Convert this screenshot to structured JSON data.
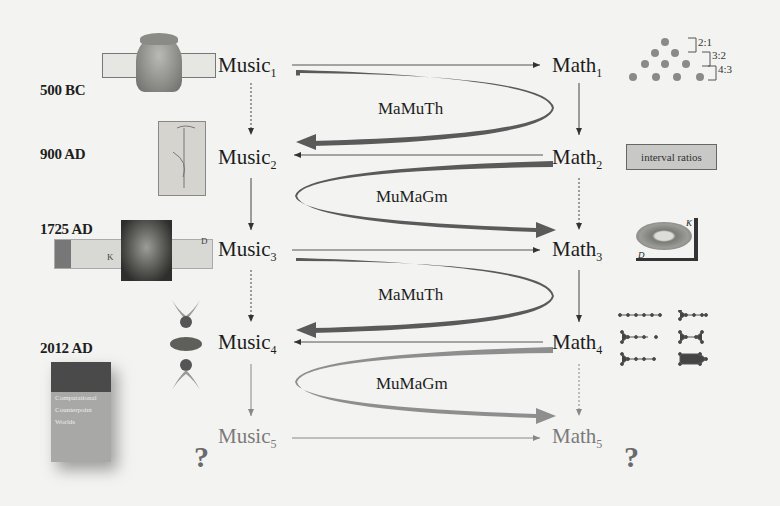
{
  "eras": [
    {
      "label": "500 BC"
    },
    {
      "label": "900 AD"
    },
    {
      "label": "1725 AD"
    },
    {
      "label": "2012 AD"
    }
  ],
  "music_nodes": [
    {
      "base": "Music",
      "index": "1"
    },
    {
      "base": "Music",
      "index": "2"
    },
    {
      "base": "Music",
      "index": "3"
    },
    {
      "base": "Music",
      "index": "4"
    },
    {
      "base": "Music",
      "index": "5"
    }
  ],
  "math_nodes": [
    {
      "base": "Math",
      "index": "1"
    },
    {
      "base": "Math",
      "index": "2"
    },
    {
      "base": "Math",
      "index": "3"
    },
    {
      "base": "Math",
      "index": "4"
    },
    {
      "base": "Math",
      "index": "5"
    }
  ],
  "loops": [
    {
      "label": "MaMuTh",
      "direction": "music-to-math-to-music"
    },
    {
      "label": "MuMaGm",
      "direction": "math-to-music-to-math"
    },
    {
      "label": "MaMuTh",
      "direction": "music-to-math-to-music"
    },
    {
      "label": "MuMaGm",
      "direction": "math-to-music-to-math"
    }
  ],
  "annotations": {
    "interval_box": "interval ratios",
    "ratios": [
      "2:1",
      "3:2",
      "4:3"
    ],
    "question_mark": "?",
    "tonnetz_labels": {
      "k": "K",
      "d": "D"
    }
  },
  "book": {
    "title_lines": [
      "Computational",
      "Counterpoint",
      "Worlds"
    ]
  },
  "colors": {
    "background": "#f3f3f1",
    "dark_arrow": "#5a5a5a",
    "light_arrow": "#8e8e8e",
    "text": "#1c1c1c",
    "faded_text": "#7a7a7a"
  }
}
